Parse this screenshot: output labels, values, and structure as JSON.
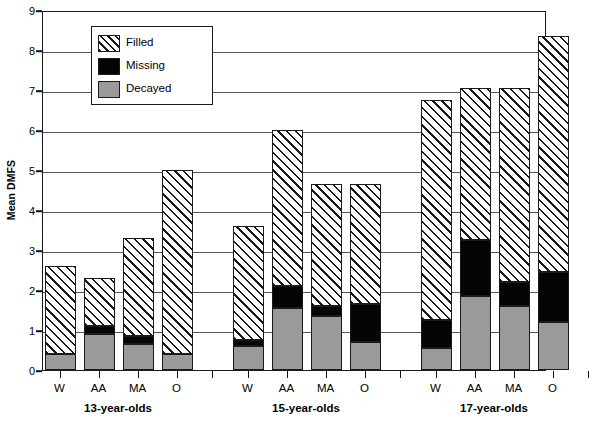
{
  "chart_data": {
    "type": "bar",
    "title": "",
    "xlabel": "",
    "ylabel": "Mean DMFS",
    "ylim": [
      0,
      9
    ],
    "ytick_labels": [
      "0",
      "1",
      "2",
      "3",
      "4",
      "5",
      "6",
      "7",
      "8",
      "9"
    ],
    "grid": true,
    "stacked": true,
    "legend_position": "top-left",
    "group_labels": [
      "13-year-olds",
      "15-year-olds",
      "17-year-olds"
    ],
    "categories": [
      "W",
      "AA",
      "MA",
      "O",
      "W",
      "AA",
      "MA",
      "O",
      "W",
      "AA",
      "MA",
      "O"
    ],
    "series": [
      {
        "name": "Decayed",
        "color": "#9a9a9a",
        "values": [
          0.4,
          0.9,
          0.65,
          0.4,
          0.6,
          1.55,
          1.35,
          0.7,
          0.55,
          1.85,
          1.6,
          1.2
        ]
      },
      {
        "name": "Missing",
        "color": "#050505",
        "values": [
          0.0,
          0.2,
          0.2,
          0.0,
          0.15,
          0.55,
          0.25,
          0.95,
          0.7,
          1.4,
          0.6,
          1.25
        ]
      },
      {
        "name": "Filled",
        "color": "hatched",
        "values": [
          2.2,
          1.2,
          2.45,
          4.6,
          2.85,
          3.9,
          3.05,
          3.0,
          5.5,
          3.8,
          4.85,
          5.9
        ]
      }
    ],
    "totals": [
      2.6,
      2.3,
      3.3,
      5.0,
      3.6,
      6.0,
      4.65,
      4.65,
      6.75,
      7.05,
      7.05,
      8.35
    ]
  },
  "legend": {
    "items": [
      {
        "label": "Filled",
        "swatch": "hatched-swatch"
      },
      {
        "label": "Missing",
        "swatch": "black-swatch"
      },
      {
        "label": "Decayed",
        "swatch": "gray-swatch"
      }
    ]
  },
  "axis": {
    "y_title": "Mean DMFS"
  }
}
